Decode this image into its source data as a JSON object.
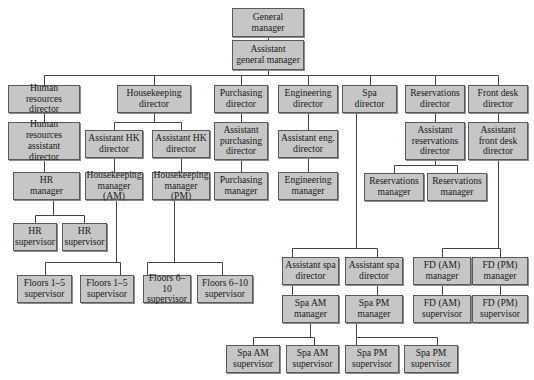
{
  "chart_data": {
    "type": "org-chart",
    "title": "",
    "root": "general_manager",
    "nodes": [
      {
        "id": "gm",
        "label": "General\nmanager",
        "parent": null,
        "box": [
          232,
          8,
          72,
          29
        ]
      },
      {
        "id": "agm",
        "label": "Assistant\ngeneral manager",
        "parent": "gm",
        "box": [
          232,
          40,
          72,
          30
        ]
      },
      {
        "id": "hr_dir",
        "label": "Human resources\ndirector",
        "parent": "agm",
        "box": [
          8,
          85,
          72,
          28
        ]
      },
      {
        "id": "hk_dir",
        "label": "Housekeeping\ndirector",
        "parent": "agm",
        "box": [
          117,
          85,
          74,
          28
        ]
      },
      {
        "id": "pur_dir",
        "label": "Purchasing\ndirector",
        "parent": "agm",
        "box": [
          214,
          85,
          54,
          28
        ]
      },
      {
        "id": "eng_dir",
        "label": "Engineering\ndirector",
        "parent": "agm",
        "box": [
          278,
          85,
          60,
          28
        ]
      },
      {
        "id": "spa_dir",
        "label": "Spa\ndirector",
        "parent": "agm",
        "box": [
          342,
          85,
          55,
          28
        ]
      },
      {
        "id": "res_dir",
        "label": "Reservations\ndirector",
        "parent": "agm",
        "box": [
          405,
          85,
          60,
          28
        ]
      },
      {
        "id": "fd_dir",
        "label": "Front desk\ndirector",
        "parent": "agm",
        "box": [
          468,
          85,
          60,
          28
        ]
      },
      {
        "id": "hr_asst",
        "label": "Human resources\nassistant\ndirector",
        "parent": "hr_dir",
        "box": [
          8,
          122,
          72,
          38
        ]
      },
      {
        "id": "hk_asst1",
        "label": "Assistant HK\ndirector",
        "parent": "hk_dir",
        "box": [
          85,
          130,
          58,
          28
        ]
      },
      {
        "id": "hk_asst2",
        "label": "Assistant HK\ndirector",
        "parent": "hk_dir",
        "box": [
          152,
          130,
          58,
          28
        ]
      },
      {
        "id": "pur_asst",
        "label": "Assistant\npurchasing\ndirector",
        "parent": "pur_dir",
        "box": [
          214,
          122,
          54,
          38
        ]
      },
      {
        "id": "eng_asst",
        "label": "Assistant eng.\ndirector",
        "parent": "eng_dir",
        "box": [
          278,
          130,
          60,
          28
        ]
      },
      {
        "id": "res_asst",
        "label": "Assistant\nreservations\ndirector",
        "parent": "res_dir",
        "box": [
          405,
          122,
          60,
          38
        ]
      },
      {
        "id": "fd_asst",
        "label": "Assistant\nfront desk\ndirector",
        "parent": "fd_dir",
        "box": [
          468,
          122,
          60,
          38
        ]
      },
      {
        "id": "hr_mgr",
        "label": "HR\nmanager",
        "parent": "hr_asst",
        "box": [
          13,
          172,
          67,
          28
        ]
      },
      {
        "id": "hk_mgr_am",
        "label": "Housekeeping\nmanager (AM)",
        "parent": "hk_asst1",
        "box": [
          85,
          172,
          58,
          28
        ]
      },
      {
        "id": "hk_mgr_pm",
        "label": "Housekeeping\nmanager (PM)",
        "parent": "hk_asst2",
        "box": [
          152,
          172,
          58,
          28
        ]
      },
      {
        "id": "pur_mgr",
        "label": "Purchasing\nmanager",
        "parent": "pur_asst",
        "box": [
          214,
          172,
          54,
          28
        ]
      },
      {
        "id": "eng_mgr",
        "label": "Engineering\nmanager",
        "parent": "eng_asst",
        "box": [
          278,
          172,
          60,
          28
        ]
      },
      {
        "id": "res_mgr1",
        "label": "Reservations\nmanager",
        "parent": "res_asst",
        "box": [
          364,
          173,
          60,
          28
        ]
      },
      {
        "id": "res_mgr2",
        "label": "Reservations\nmanager",
        "parent": "res_asst",
        "box": [
          427,
          173,
          60,
          28
        ]
      },
      {
        "id": "hr_sup1",
        "label": "HR\nsupervisor",
        "parent": "hr_mgr",
        "box": [
          13,
          223,
          44,
          28
        ]
      },
      {
        "id": "hr_sup2",
        "label": "HR\nsupervisor",
        "parent": "hr_mgr",
        "box": [
          62,
          223,
          45,
          28
        ]
      },
      {
        "id": "fl15_1",
        "label": "Floors 1–5\nsupervisor",
        "parent": "hk_mgr_am",
        "box": [
          17,
          275,
          55,
          28
        ]
      },
      {
        "id": "fl15_2",
        "label": "Floors 1–5\nsupervisor",
        "parent": "hk_mgr_am",
        "box": [
          80,
          275,
          54,
          28
        ]
      },
      {
        "id": "fl610_1",
        "label": "Floors 6–10\nsupervisor",
        "parent": "hk_mgr_pm",
        "box": [
          143,
          275,
          48,
          28
        ]
      },
      {
        "id": "fl610_2",
        "label": "Floors 6–10\nsupervisor",
        "parent": "hk_mgr_pm",
        "box": [
          197,
          275,
          56,
          28
        ]
      },
      {
        "id": "spa_asst1",
        "label": "Assistant spa\ndirector",
        "parent": "spa_dir",
        "box": [
          282,
          257,
          57,
          28
        ]
      },
      {
        "id": "spa_asst2",
        "label": "Assistant spa\ndirector",
        "parent": "spa_dir",
        "box": [
          345,
          257,
          58,
          28
        ]
      },
      {
        "id": "spa_am_mgr",
        "label": "Spa AM\nmanager",
        "parent": "spa_asst1",
        "box": [
          282,
          295,
          57,
          28
        ]
      },
      {
        "id": "spa_pm_mgr",
        "label": "Spa PM\nmanager",
        "parent": "spa_asst2",
        "box": [
          345,
          295,
          58,
          28
        ]
      },
      {
        "id": "spa_am_sup1",
        "label": "Spa AM\nsupervisor",
        "parent": "spa_am_mgr",
        "box": [
          226,
          345,
          54,
          28
        ]
      },
      {
        "id": "spa_am_sup2",
        "label": "Spa AM\nsupervisor",
        "parent": "spa_am_mgr",
        "box": [
          286,
          345,
          53,
          28
        ]
      },
      {
        "id": "spa_pm_sup1",
        "label": "Spa PM\nsupervisor",
        "parent": "spa_pm_mgr",
        "box": [
          345,
          345,
          54,
          28
        ]
      },
      {
        "id": "spa_pm_sup2",
        "label": "Spa PM\nsupervisor",
        "parent": "spa_pm_mgr",
        "box": [
          404,
          345,
          54,
          28
        ]
      },
      {
        "id": "fd_am_mgr",
        "label": "FD (AM)\nmanager",
        "parent": "fd_asst",
        "box": [
          413,
          257,
          58,
          28
        ]
      },
      {
        "id": "fd_pm_mgr",
        "label": "FD (PM)\nmanager",
        "parent": "fd_asst",
        "box": [
          472,
          257,
          56,
          28
        ]
      },
      {
        "id": "fd_am_sup",
        "label": "FD (AM)\nsupervisor",
        "parent": "fd_am_mgr",
        "box": [
          413,
          295,
          58,
          28
        ]
      },
      {
        "id": "fd_pm_sup",
        "label": "FD (PM)\nsupervisor",
        "parent": "fd_pm_mgr",
        "box": [
          472,
          295,
          56,
          28
        ]
      }
    ],
    "connectors": [
      [
        268,
        37,
        268,
        40
      ],
      [
        268,
        70,
        268,
        75
      ],
      [
        44,
        75,
        498,
        75
      ],
      [
        44,
        75,
        44,
        85
      ],
      [
        154,
        75,
        154,
        85
      ],
      [
        241,
        75,
        241,
        85
      ],
      [
        308,
        75,
        308,
        85
      ],
      [
        370,
        75,
        370,
        85
      ],
      [
        435,
        75,
        435,
        85
      ],
      [
        498,
        75,
        498,
        85
      ],
      [
        44,
        113,
        44,
        122
      ],
      [
        154,
        113,
        154,
        122
      ],
      [
        114,
        122,
        181,
        122
      ],
      [
        114,
        122,
        114,
        130
      ],
      [
        181,
        122,
        181,
        130
      ],
      [
        241,
        113,
        241,
        122
      ],
      [
        308,
        113,
        308,
        130
      ],
      [
        435,
        113,
        435,
        122
      ],
      [
        498,
        113,
        498,
        122
      ],
      [
        44,
        160,
        44,
        172
      ],
      [
        114,
        158,
        114,
        172
      ],
      [
        181,
        158,
        181,
        172
      ],
      [
        241,
        160,
        241,
        172
      ],
      [
        308,
        158,
        308,
        172
      ],
      [
        435,
        160,
        435,
        165
      ],
      [
        394,
        165,
        457,
        165
      ],
      [
        394,
        165,
        394,
        173
      ],
      [
        457,
        165,
        457,
        173
      ],
      [
        53,
        200,
        53,
        215
      ],
      [
        35,
        215,
        84,
        215
      ],
      [
        35,
        215,
        35,
        223
      ],
      [
        84,
        215,
        84,
        223
      ],
      [
        116,
        200,
        116,
        262
      ],
      [
        45,
        262,
        120,
        262
      ],
      [
        45,
        262,
        45,
        275
      ],
      [
        120,
        262,
        120,
        275
      ],
      [
        174,
        200,
        174,
        262
      ],
      [
        147,
        262,
        222,
        262
      ],
      [
        147,
        262,
        147,
        275
      ],
      [
        222,
        262,
        222,
        275
      ],
      [
        356,
        113,
        356,
        248
      ],
      [
        292,
        248,
        377,
        248
      ],
      [
        292,
        248,
        292,
        257
      ],
      [
        377,
        248,
        377,
        257
      ],
      [
        292,
        285,
        292,
        295
      ],
      [
        377,
        285,
        377,
        295
      ],
      [
        310,
        323,
        310,
        337
      ],
      [
        253,
        337,
        314,
        337
      ],
      [
        253,
        337,
        253,
        345
      ],
      [
        314,
        337,
        314,
        345
      ],
      [
        356,
        323,
        356,
        337
      ],
      [
        356,
        337,
        437,
        337
      ],
      [
        356,
        337,
        356,
        345
      ],
      [
        437,
        337,
        437,
        345
      ],
      [
        498,
        160,
        498,
        248
      ],
      [
        442,
        248,
        500,
        248
      ],
      [
        442,
        248,
        442,
        257
      ],
      [
        500,
        248,
        500,
        257
      ],
      [
        442,
        285,
        442,
        295
      ],
      [
        500,
        285,
        500,
        295
      ]
    ]
  }
}
